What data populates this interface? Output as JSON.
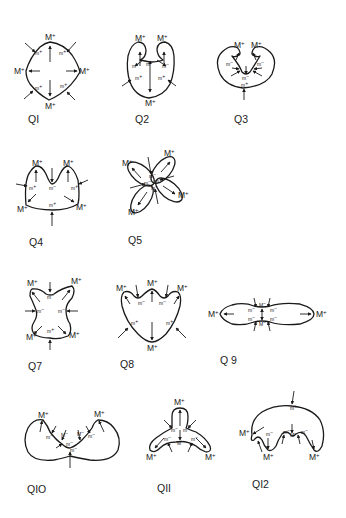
{
  "figure": {
    "labels": {
      "max_plus": "M",
      "min_plus": "m",
      "min_minus": "m",
      "sup_plus": "+",
      "sup_minus": "−"
    },
    "panels": [
      {
        "id": "Q1",
        "caption": "QI"
      },
      {
        "id": "Q2",
        "caption": "Q2"
      },
      {
        "id": "Q3",
        "caption": "Q3"
      },
      {
        "id": "Q4",
        "caption": "Q4"
      },
      {
        "id": "Q5",
        "caption": "Q5"
      },
      {
        "id": "Q6",
        "caption": "Q6"
      },
      {
        "id": "Q7",
        "caption": "Q7"
      },
      {
        "id": "Q8",
        "caption": "Q8"
      },
      {
        "id": "Q9",
        "caption": "Q 9"
      },
      {
        "id": "Q10",
        "caption": "QIO"
      },
      {
        "id": "Q11",
        "caption": "QII"
      },
      {
        "id": "Q12",
        "caption": "QI2"
      }
    ],
    "colors": {
      "ink": "#1a1a1a",
      "background": "#ffffff"
    }
  }
}
